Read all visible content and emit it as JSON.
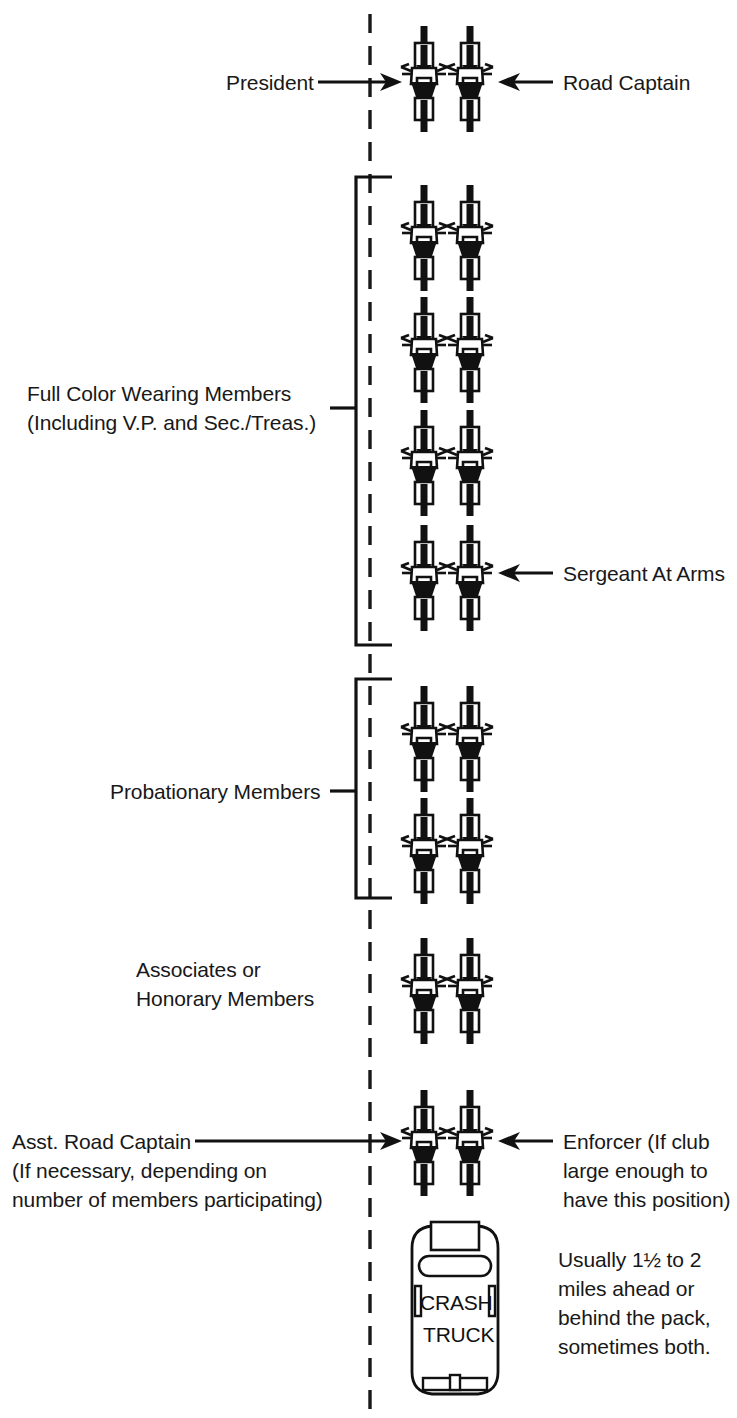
{
  "diagram": {
    "center_line": "dashed-center-line",
    "colors": {
      "ink": "#181818",
      "background": "#ffffff",
      "fill_dark": "#111111"
    }
  },
  "labels": {
    "president": "President",
    "road_captain": "Road Captain",
    "full_color_line1": "Full Color Wearing Members",
    "full_color_line2": "(Including V.P. and Sec./Treas.)",
    "sergeant_at_arms": "Sergeant At Arms",
    "probationary": "Probationary Members",
    "associates_line1": "Associates or",
    "associates_line2": "Honorary Members",
    "asst_road_captain_line1": "Asst. Road Captain",
    "asst_road_captain_line2": "(If necessary, depending on",
    "asst_road_captain_line3": "number of members participating)",
    "enforcer_line1": "Enforcer (If club",
    "enforcer_line2": "large enough to",
    "enforcer_line3": "have this position)",
    "crash_truck_line1": "Usually 1½ to 2",
    "crash_truck_line2": "miles ahead or",
    "crash_truck_line3": "behind the pack,",
    "crash_truck_line4": "sometimes both."
  },
  "truck": {
    "label_line1": "CRASH",
    "label_line2": "TRUCK"
  },
  "formation": {
    "groups": [
      {
        "name": "leadership",
        "rows": 1,
        "positions": [
          "President",
          "Road Captain"
        ]
      },
      {
        "name": "full-color-wearing-members",
        "rows": 4,
        "note": "Including V.P. and Sec./Treas.; last right rider is Sergeant At Arms"
      },
      {
        "name": "probationary-members",
        "rows": 2
      },
      {
        "name": "associates-or-honorary-members",
        "rows": 1
      },
      {
        "name": "trailing-officers",
        "rows": 1,
        "positions": [
          "Asst. Road Captain",
          "Enforcer"
        ]
      },
      {
        "name": "crash-truck",
        "rows": 1
      }
    ],
    "bike_columns_x": [
      424,
      470
    ],
    "bike_row_y": [
      76,
      235,
      347,
      460,
      575,
      736,
      848,
      988,
      1140
    ]
  }
}
